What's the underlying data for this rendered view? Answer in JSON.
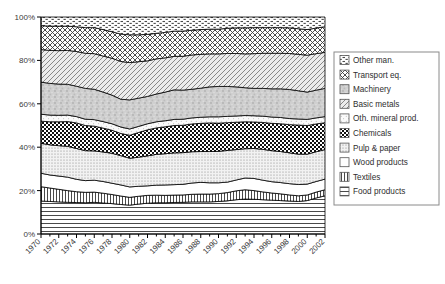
{
  "chart_data": {
    "type": "area",
    "stacked": true,
    "normalized": "100%",
    "title": "",
    "xlabel": "",
    "ylabel": "",
    "ylim": [
      0,
      100
    ],
    "ytick_labels": [
      "0%",
      "20%",
      "40%",
      "60%",
      "80%",
      "100%"
    ],
    "ytick_values": [
      0,
      20,
      40,
      60,
      80,
      100
    ],
    "grid": false,
    "legend_position": "right",
    "x": [
      1970,
      1971,
      1972,
      1973,
      1974,
      1975,
      1976,
      1977,
      1978,
      1979,
      1980,
      1981,
      1982,
      1983,
      1984,
      1985,
      1986,
      1987,
      1988,
      1989,
      1990,
      1991,
      1992,
      1993,
      1994,
      1995,
      1996,
      1997,
      1998,
      1999,
      2000,
      2001,
      2002
    ],
    "xtick_labels": [
      "1970",
      "1972",
      "1974",
      "1976",
      "1978",
      "1980",
      "1982",
      "1984",
      "1986",
      "1988",
      "1990",
      "1992",
      "1994",
      "1996",
      "1998",
      "2000",
      "2002"
    ],
    "xtick_values": [
      1970,
      1972,
      1974,
      1976,
      1978,
      1980,
      1982,
      1984,
      1986,
      1988,
      1990,
      1992,
      1994,
      1996,
      1998,
      2000,
      2002
    ],
    "minor_ticks_every": 1,
    "stack_order_bottom_to_top": [
      "Food products",
      "Textiles",
      "Wood products",
      "Pulp & paper",
      "Chemicals",
      "Oth. mineral prod.",
      "Machinery",
      "Basic metals",
      "Transport eq.",
      "Other man."
    ],
    "series": [
      {
        "name": "Food products",
        "pattern": "horizontal-lines",
        "values": [
          15.2,
          15.0,
          14.8,
          14.6,
          14.5,
          14.4,
          14.6,
          14.3,
          14.0,
          13.6,
          13.3,
          13.8,
          14.2,
          14.4,
          14.4,
          14.5,
          14.6,
          14.8,
          14.8,
          14.8,
          15.0,
          15.3,
          15.8,
          16.1,
          16.0,
          15.8,
          15.6,
          15.4,
          15.2,
          15.0,
          15.4,
          16.6,
          17.6
        ]
      },
      {
        "name": "Textiles",
        "pattern": "vertical-lines",
        "values": [
          6.6,
          6.2,
          5.8,
          5.4,
          5.0,
          4.8,
          4.7,
          4.5,
          4.2,
          3.9,
          3.6,
          3.6,
          3.6,
          3.5,
          3.4,
          3.4,
          3.4,
          3.5,
          3.6,
          3.6,
          3.6,
          3.8,
          4.1,
          4.3,
          4.0,
          3.6,
          3.3,
          3.1,
          2.8,
          2.6,
          2.6,
          2.7,
          2.8
        ]
      },
      {
        "name": "Wood products",
        "pattern": "solid-white",
        "values": [
          6.2,
          6.0,
          6.1,
          6.2,
          5.7,
          5.4,
          5.5,
          5.4,
          5.2,
          5.1,
          4.8,
          4.6,
          4.4,
          4.6,
          4.8,
          4.8,
          4.9,
          5.2,
          5.4,
          5.2,
          5.0,
          4.8,
          5.0,
          5.4,
          5.6,
          5.4,
          5.2,
          5.2,
          5.2,
          5.2,
          5.0,
          4.9,
          4.9
        ]
      },
      {
        "name": "Pulp & paper",
        "pattern": "fine-dots",
        "values": [
          13.8,
          13.9,
          14.0,
          14.2,
          14.2,
          13.8,
          13.5,
          13.6,
          13.8,
          13.5,
          13.2,
          13.4,
          13.8,
          14.2,
          14.4,
          14.6,
          14.6,
          14.4,
          14.2,
          14.4,
          14.5,
          14.6,
          14.0,
          13.5,
          13.8,
          14.2,
          14.3,
          14.3,
          14.2,
          14.0,
          13.8,
          13.7,
          13.6
        ]
      },
      {
        "name": "Chemicals",
        "pattern": "checkerboard",
        "values": [
          10.2,
          10.6,
          11.0,
          11.4,
          11.8,
          11.6,
          11.4,
          11.0,
          10.6,
          10.2,
          10.6,
          11.4,
          12.0,
          12.2,
          12.4,
          12.6,
          12.6,
          12.8,
          13.0,
          13.2,
          13.0,
          12.8,
          12.6,
          12.4,
          12.2,
          12.4,
          12.6,
          12.8,
          13.0,
          13.4,
          13.2,
          12.8,
          12.4
        ]
      },
      {
        "name": "Oth. mineral prod.",
        "pattern": "sparse-dots",
        "values": [
          3.2,
          3.1,
          3.0,
          3.0,
          2.9,
          2.9,
          3.0,
          3.0,
          3.0,
          3.0,
          2.9,
          2.8,
          2.8,
          2.8,
          2.8,
          2.8,
          2.8,
          2.8,
          2.8,
          2.8,
          2.9,
          2.9,
          2.9,
          2.9,
          2.9,
          2.9,
          2.9,
          2.9,
          2.8,
          2.8,
          2.8,
          2.8,
          2.8
        ]
      },
      {
        "name": "Machinery",
        "pattern": "gray-speckle",
        "values": [
          14.8,
          14.6,
          14.4,
          14.2,
          14.0,
          14.2,
          14.0,
          13.6,
          13.2,
          12.8,
          13.4,
          13.0,
          12.6,
          12.8,
          13.2,
          13.6,
          13.4,
          13.2,
          13.4,
          13.8,
          14.0,
          13.8,
          13.4,
          12.8,
          12.6,
          12.8,
          13.0,
          13.2,
          13.4,
          13.0,
          12.6,
          12.8,
          13.0
        ]
      },
      {
        "name": "Basic metals",
        "pattern": "diagonal-hatch",
        "values": [
          15.0,
          15.2,
          15.4,
          15.6,
          16.0,
          16.2,
          16.4,
          16.6,
          17.0,
          17.4,
          17.2,
          16.8,
          16.4,
          16.2,
          15.8,
          15.4,
          15.6,
          15.8,
          15.6,
          15.2,
          15.0,
          15.2,
          15.4,
          15.6,
          16.0,
          16.2,
          16.4,
          16.4,
          16.6,
          16.8,
          17.0,
          16.8,
          16.6
        ]
      },
      {
        "name": "Transport eq.",
        "pattern": "diagonal-crosshatch",
        "values": [
          11.0,
          11.2,
          11.3,
          11.2,
          11.4,
          11.8,
          12.0,
          12.2,
          12.2,
          12.6,
          12.8,
          12.4,
          12.2,
          11.8,
          11.7,
          11.6,
          11.6,
          11.4,
          11.4,
          11.4,
          11.4,
          11.6,
          11.8,
          12.0,
          12.0,
          11.8,
          11.8,
          11.8,
          11.8,
          11.8,
          11.8,
          11.8,
          11.8
        ]
      },
      {
        "name": "Other man.",
        "pattern": "dash-dots",
        "values": [
          4.0,
          4.2,
          4.2,
          4.2,
          4.5,
          4.9,
          4.9,
          5.8,
          6.8,
          7.9,
          8.2,
          8.2,
          8.0,
          7.5,
          7.1,
          6.5,
          6.5,
          6.1,
          5.8,
          5.6,
          5.6,
          5.2,
          5.0,
          5.0,
          4.9,
          4.9,
          4.9,
          4.9,
          5.0,
          5.4,
          5.8,
          5.1,
          4.5
        ]
      }
    ]
  },
  "legend": {
    "items": [
      {
        "label": "Other man.",
        "pattern": "dash-dots"
      },
      {
        "label": "Transport eq.",
        "pattern": "diagonal-crosshatch"
      },
      {
        "label": "Machinery",
        "pattern": "gray-speckle"
      },
      {
        "label": "Basic metals",
        "pattern": "diagonal-hatch"
      },
      {
        "label": "Oth. mineral prod.",
        "pattern": "sparse-dots"
      },
      {
        "label": "Chemicals",
        "pattern": "checkerboard"
      },
      {
        "label": "Pulp & paper",
        "pattern": "fine-dots"
      },
      {
        "label": "Wood products",
        "pattern": "solid-white"
      },
      {
        "label": "Textiles",
        "pattern": "vertical-lines"
      },
      {
        "label": "Food products",
        "pattern": "horizontal-lines"
      }
    ]
  },
  "colors": {
    "axis": "#000000",
    "text": "#2e2e2e",
    "background": "#ffffff",
    "legend_border": "#8a8a8a",
    "series_outline": "#000000"
  }
}
